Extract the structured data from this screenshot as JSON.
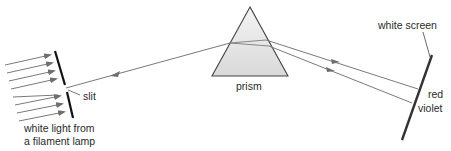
{
  "diagram": {
    "labels": {
      "slit": "slit",
      "source_line1": "white light from",
      "source_line2": "a filament lamp",
      "prism": "prism",
      "screen": "white screen",
      "red": "red",
      "violet": "violet"
    },
    "colors": {
      "ray": "#7a7a7a",
      "arrow": "#6e6e6e",
      "slit_barrier": "#111111",
      "screen": "#333333",
      "prism_fill": "#e6e6e6",
      "prism_edge": "#444444",
      "text": "#2a2a2a"
    },
    "components": [
      "light source rays",
      "slit",
      "prism",
      "dispersed beams",
      "white screen"
    ]
  }
}
